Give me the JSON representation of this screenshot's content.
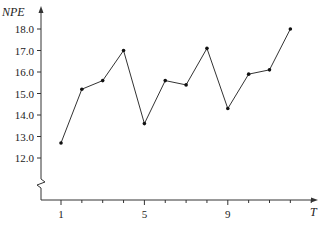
{
  "chart_data": {
    "type": "line",
    "title": "",
    "xlabel": "T",
    "ylabel": "NPE",
    "x": [
      1,
      2,
      3,
      4,
      5,
      6,
      7,
      8,
      9,
      10,
      11,
      12
    ],
    "series": [
      {
        "name": "NPE",
        "values": [
          12.7,
          15.2,
          15.6,
          17.0,
          13.6,
          15.6,
          15.4,
          17.1,
          14.3,
          15.9,
          16.1,
          18.0
        ]
      }
    ],
    "yticks": [
      "12.0",
      "13.0",
      "14.0",
      "15.0",
      "16.0",
      "17.0",
      "18.0"
    ],
    "xtick_labels": {
      "1": "1",
      "5": "5",
      "9": "9"
    },
    "ylim": [
      12.0,
      18.0
    ],
    "xlim": [
      1,
      13
    ],
    "y_axis_break": true,
    "grid": false,
    "legend": null,
    "colors": {
      "line": "#333333",
      "marker": "#111111",
      "axis": "#333333"
    }
  }
}
